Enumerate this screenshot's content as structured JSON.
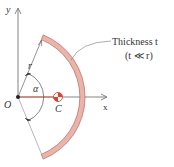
{
  "diagram": {
    "type": "circular-arc-centroid",
    "colors": {
      "arc_fill": "#e9b4aa",
      "arc_stroke": "#b5514a",
      "axis": "#555555",
      "accent": "#d9442e",
      "text": "#333333"
    },
    "labels": {
      "y_axis": "y",
      "x_axis": "x",
      "origin": "O",
      "radius": "r",
      "angle": "α",
      "centroid": "C",
      "thickness_line1": "Thickness t",
      "thickness_line2": "(t ≪ r)"
    },
    "icons": {
      "centroid": "centroid-symbol-icon"
    }
  }
}
